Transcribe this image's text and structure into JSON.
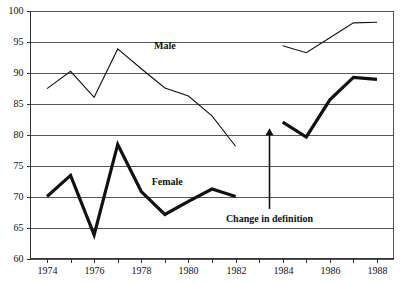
{
  "chart_data": {
    "type": "line",
    "title": "",
    "xlabel": "",
    "ylabel": "",
    "xlim": [
      1973.3,
      1988.7
    ],
    "ylim": [
      60,
      100
    ],
    "grid": true,
    "legend_position": "inline-labels",
    "y_ticks": [
      60,
      65,
      70,
      75,
      80,
      85,
      90,
      95,
      100
    ],
    "y_tick_labels": [
      "60",
      "65",
      "70",
      "75",
      "80",
      "85",
      "90",
      "95",
      "100"
    ],
    "x_ticks": [
      1974,
      1975,
      1976,
      1977,
      1978,
      1979,
      1980,
      1981,
      1982,
      1983,
      1984,
      1985,
      1986,
      1987,
      1988
    ],
    "x_tick_labels": [
      "1974",
      "",
      "1976",
      "",
      "1978",
      "",
      "1980",
      "",
      "1982",
      "",
      "1984",
      "",
      "1986",
      "",
      "1988"
    ],
    "x_labeled_ticks": [
      {
        "x": 1974,
        "label": "1974"
      },
      {
        "x": 1976,
        "label": "1976"
      },
      {
        "x": 1978,
        "label": "1978"
      },
      {
        "x": 1980,
        "label": "1980"
      },
      {
        "x": 1982,
        "label": "1982"
      },
      {
        "x": 1984,
        "label": "1984"
      },
      {
        "x": 1986,
        "label": "1986"
      },
      {
        "x": 1988,
        "label": "1988"
      }
    ],
    "series": [
      {
        "name": "Male",
        "style": "thin",
        "label_at": {
          "x": 1979.0,
          "y": 94.2
        },
        "segments": [
          {
            "name": "Male before definition change",
            "x": [
              1974,
              1975,
              1976,
              1977,
              1978,
              1979,
              1980,
              1981,
              1982
            ],
            "values": [
              87.4,
              90.2,
              86.0,
              93.8,
              90.6,
              87.5,
              86.2,
              83.0,
              78.1
            ]
          },
          {
            "name": "Male after definition change",
            "x": [
              1984,
              1985,
              1986,
              1987,
              1988
            ],
            "values": [
              94.3,
              93.2,
              95.6,
              98.0,
              98.1
            ]
          }
        ]
      },
      {
        "name": "Female",
        "style": "thick",
        "label_at": {
          "x": 1979.1,
          "y": 72.2
        },
        "segments": [
          {
            "name": "Female before definition change",
            "x": [
              1974,
              1975,
              1976,
              1977,
              1978,
              1979,
              1980,
              1981,
              1982
            ],
            "values": [
              70.0,
              73.4,
              63.8,
              78.4,
              70.8,
              67.1,
              69.2,
              71.2,
              70.0
            ]
          },
          {
            "name": "Female after definition change",
            "x": [
              1984,
              1985,
              1986,
              1987,
              1988
            ],
            "values": [
              82.0,
              79.6,
              85.6,
              89.2,
              88.9
            ]
          }
        ]
      }
    ],
    "annotations": [
      {
        "name": "change-in-definition",
        "text": "Change in definition",
        "arrow_x": 1983.4,
        "arrow_y_start": 68.0,
        "arrow_y_end": 81.0,
        "text_y": 67.0
      }
    ]
  }
}
